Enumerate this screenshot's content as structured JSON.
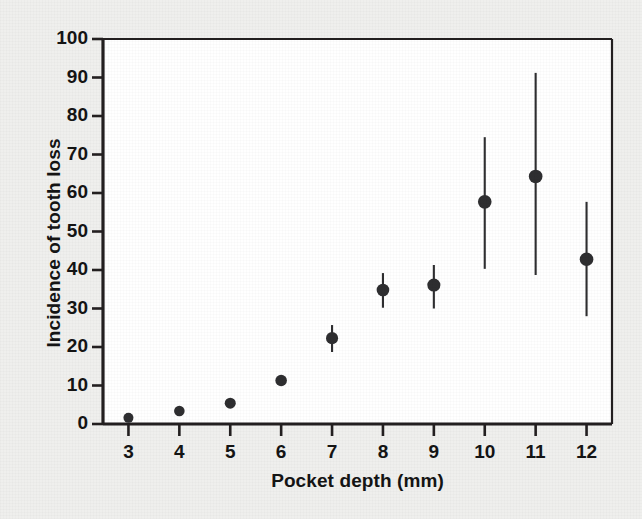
{
  "figure": {
    "background_color": "#efefed",
    "plot_background_color": "#ffffff",
    "ink_color": "#231f20",
    "marker_color": "#2e2e30"
  },
  "chart_data": {
    "type": "scatter",
    "title": "",
    "subtitle": "",
    "xlabel": "Pocket depth (mm)",
    "ylabel": "Incidence of tooth loss",
    "xlim": [
      2.5,
      12.5
    ],
    "ylim": [
      0,
      100
    ],
    "xticks": [
      3,
      4,
      5,
      6,
      7,
      8,
      9,
      10,
      11,
      12
    ],
    "xtick_labels": [
      "3",
      "4",
      "5",
      "6",
      "7",
      "8",
      "9",
      "10",
      "11",
      "12"
    ],
    "yticks": [
      0,
      10,
      20,
      30,
      40,
      50,
      60,
      70,
      80,
      90,
      100
    ],
    "ytick_labels": [
      "0",
      "10",
      "20",
      "30",
      "40",
      "50",
      "60",
      "70",
      "80",
      "90",
      "100"
    ],
    "grid": false,
    "legend": null,
    "legend_position": "none",
    "annotations": [],
    "x": [
      3,
      4,
      5,
      6,
      7,
      8,
      9,
      10,
      11,
      12
    ],
    "values": [
      1.6,
      3.4,
      5.4,
      11.3,
      22.3,
      34.8,
      36.1,
      57.7,
      64.3,
      42.8
    ],
    "error_low": [
      1.6,
      3.4,
      5.4,
      11.3,
      18.7,
      30.2,
      30.0,
      40.3,
      38.7,
      28.0
    ],
    "error_high": [
      1.6,
      3.4,
      5.4,
      11.3,
      25.7,
      39.2,
      41.3,
      74.5,
      91.2,
      57.7
    ],
    "series": [
      {
        "name": "Incidence of tooth loss",
        "marker": "filled-circle",
        "values": [
          1.6,
          3.4,
          5.4,
          11.3,
          22.3,
          34.8,
          36.1,
          57.7,
          64.3,
          42.8
        ]
      }
    ],
    "points": [
      {
        "x": 3,
        "y": 1.6,
        "low": 1.6,
        "high": 1.6,
        "has_error_bar": false
      },
      {
        "x": 4,
        "y": 3.4,
        "low": 3.4,
        "high": 3.4,
        "has_error_bar": false
      },
      {
        "x": 5,
        "y": 5.4,
        "low": 5.4,
        "high": 5.4,
        "has_error_bar": false
      },
      {
        "x": 6,
        "y": 11.3,
        "low": 11.3,
        "high": 11.3,
        "has_error_bar": false
      },
      {
        "x": 7,
        "y": 22.3,
        "low": 18.7,
        "high": 25.7,
        "has_error_bar": true
      },
      {
        "x": 8,
        "y": 34.8,
        "low": 30.2,
        "high": 39.2,
        "has_error_bar": true
      },
      {
        "x": 9,
        "y": 36.1,
        "low": 30.0,
        "high": 41.3,
        "has_error_bar": true
      },
      {
        "x": 10,
        "y": 57.7,
        "low": 40.3,
        "high": 74.5,
        "has_error_bar": true
      },
      {
        "x": 11,
        "y": 64.3,
        "low": 38.7,
        "high": 91.2,
        "has_error_bar": true
      },
      {
        "x": 12,
        "y": 42.8,
        "low": 28.0,
        "high": 57.7,
        "has_error_bar": true
      }
    ]
  }
}
